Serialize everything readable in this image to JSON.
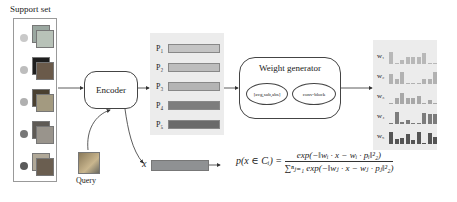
{
  "support_set": {
    "title": "Support set",
    "classes": [
      {
        "dot_color": "#c9c9c9",
        "thumb_colors": [
          "#9aa7a0",
          "#b8c2b8"
        ]
      },
      {
        "dot_color": "#bdbdbd",
        "thumb_colors": [
          "#1e1e1e",
          "#6a5a4a"
        ]
      },
      {
        "dot_color": "#b0b0b0",
        "thumb_colors": [
          "#4a4030",
          "#a39a80"
        ]
      },
      {
        "dot_color": "#777777",
        "thumb_colors": [
          "#5e5a55",
          "#99948c"
        ]
      },
      {
        "dot_color": "#5a5a5a",
        "thumb_colors": [
          "#b0a898",
          "#6a5e50"
        ]
      }
    ]
  },
  "query": {
    "label": "Query"
  },
  "encoder": {
    "label": "Encoder"
  },
  "prototypes": {
    "items": [
      {
        "label": "P₁",
        "color": "#c4c4c4"
      },
      {
        "label": "P₂",
        "color": "#bdbdbd"
      },
      {
        "label": "P₃",
        "color": "#b4b4b4"
      },
      {
        "label": "P₄",
        "color": "#7d7d7d"
      },
      {
        "label": "P₅",
        "color": "#6a6a6a"
      }
    ]
  },
  "weight_generator": {
    "title": "Weight generator",
    "ops_label": "[avg,sub,abs]",
    "block_label": "conv-block"
  },
  "weights": {
    "items": [
      {
        "label": "w₁",
        "color": "#b8b8b8",
        "bars": [
          10,
          1,
          3,
          6,
          6,
          6,
          9,
          1,
          1
        ]
      },
      {
        "label": "w₂",
        "color": "#b2b2b2",
        "bars": [
          8,
          4,
          10,
          1,
          1,
          1,
          4,
          4,
          10
        ]
      },
      {
        "label": "w₃",
        "color": "#a8a8a8",
        "bars": [
          1,
          5,
          9,
          5,
          5,
          7,
          1,
          3,
          1
        ]
      },
      {
        "label": "w₄",
        "color": "#7c7c7c",
        "bars": [
          1,
          10,
          2,
          3,
          1,
          1,
          9,
          8,
          8
        ]
      },
      {
        "label": "w₅",
        "color": "#555555",
        "bars": [
          10,
          4,
          5,
          8,
          3,
          10,
          1,
          9,
          6
        ]
      }
    ]
  },
  "query_embedding": {
    "label": "x",
    "color": "#8f9193"
  },
  "formula": {
    "lhs": "p(x ∈ Cᵢ) =",
    "numerator": "exp(−‖wᵢ · x − wᵢ · pᵢ‖²₂)",
    "denominator": "∑ⁿⱼ₌₁ exp(−‖wⱼ · x − wⱼ · pⱼ‖²₂)"
  }
}
